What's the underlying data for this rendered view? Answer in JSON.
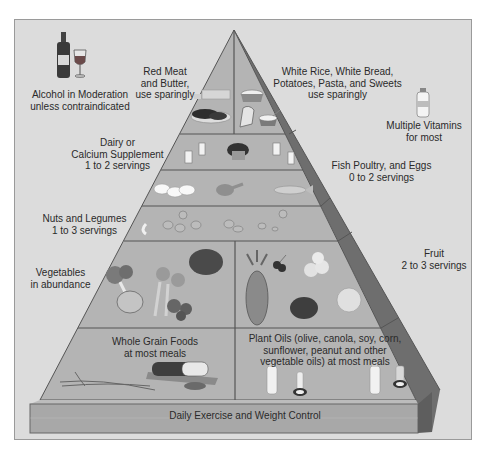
{
  "colors": {
    "background": "#ffffff",
    "panel": "#dcdcdc",
    "pyramid_face": "#b4b4b4",
    "pyramid_side": "#6e6e6e",
    "tier_line": "#555555",
    "base_slab": "#a8a8a8",
    "text": "#2a2a2a"
  },
  "outside_labels": {
    "alcohol": [
      "Alcohol in Moderation",
      "unless contraindicated"
    ],
    "vitamins": [
      "Multiple Vitamins",
      "for most"
    ]
  },
  "tiers": [
    {
      "id": "top-left",
      "label": [
        "Red Meat",
        "and Butter,",
        "use sparingly"
      ],
      "foods": [
        "steak",
        "butter"
      ]
    },
    {
      "id": "top-right",
      "label": [
        "White Rice, White Bread,",
        "Potatoes, Pasta, and Sweets",
        "use sparingly"
      ],
      "foods": [
        "rice bowl",
        "bread",
        "sweets dish"
      ]
    },
    {
      "id": "dairy",
      "label": [
        "Dairy or",
        "Calcium Supplement",
        "1 to 2 servings"
      ],
      "foods": [
        "milk glasses",
        "cheese",
        "yogurt"
      ]
    },
    {
      "id": "fish-poultry-eggs",
      "label": [
        "Fish Poultry, and Eggs",
        "0 to 2 servings"
      ],
      "foods": [
        "eggs",
        "chicken leg",
        "fish"
      ]
    },
    {
      "id": "nuts-legumes",
      "label": [
        "Nuts and Legumes",
        "1 to 3 servings"
      ],
      "foods": [
        "cashews",
        "beans",
        "legumes"
      ]
    },
    {
      "id": "vegetables",
      "label": [
        "Vegetables",
        "in abundance"
      ],
      "foods": [
        "broccoli",
        "cabbage",
        "carrots",
        "mushrooms",
        "tomato"
      ]
    },
    {
      "id": "fruit",
      "label": [
        "Fruit",
        "2 to 3 servings"
      ],
      "foods": [
        "pineapple",
        "cherries",
        "peaches",
        "grapes",
        "orange"
      ]
    },
    {
      "id": "whole-grains",
      "label": [
        "Whole Grain Foods",
        "at most meals"
      ],
      "foods": [
        "wheat stalks",
        "whole grain bread loaf"
      ]
    },
    {
      "id": "plant-oils",
      "label": [
        "Plant Oils (olive, canola, soy, corn,",
        "sunflower, peanut and other",
        "vegetable oils) at most meals"
      ],
      "foods": [
        "oil bottles"
      ]
    }
  ],
  "base": {
    "label": "Daily Exercise and Weight Control"
  }
}
